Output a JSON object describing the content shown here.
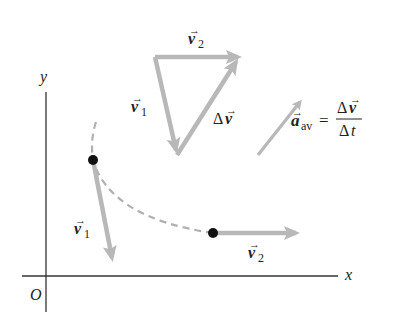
{
  "diagram": {
    "axes": {
      "x_label": "x",
      "y_label": "y",
      "origin_label": "O"
    },
    "path": {
      "style": "dashed",
      "points": [
        {
          "name": "P1",
          "velocity_label": "v1"
        },
        {
          "name": "P2",
          "velocity_label": "v2"
        }
      ]
    },
    "labels": {
      "v1_sub": "1",
      "v2_sub": "2",
      "v": "v",
      "delta": "Δ",
      "a": "a",
      "av": "av",
      "equals": "=",
      "t": "t"
    },
    "vector_triangle": {
      "sides": [
        "v2",
        "v1",
        "Δv"
      ]
    },
    "equation": "a_av = Δv / Δt",
    "colors": {
      "vector_arrow": "#b8b8b8",
      "axis": "#333333",
      "dot": "#111111",
      "dashed_path": "#b0b0b0"
    }
  }
}
